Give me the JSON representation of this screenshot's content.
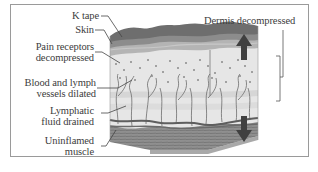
{
  "figure": {
    "labels": {
      "k_tape": "K tape",
      "skin": "Skin",
      "pain_receptors_line1": "Pain receptors",
      "pain_receptors_line2": "decompressed",
      "blood_lymph_line1": "Blood and lymph",
      "blood_lymph_line2": "vessels dilated",
      "lymphatic_line1": "Lymphatic",
      "lymphatic_line2": "fluid drained",
      "muscle_line1": "Uninflamed",
      "muscle_line2": "muscle",
      "dermis": "Dermis decompressed"
    },
    "colors": {
      "frame_border": "#9a9a9a",
      "k_tape_layer": "#6e6e6e",
      "skin_layer": "#8c8c8c",
      "epidermis_band": "#b4b4b4",
      "dermis_fill": "#e6e6e6",
      "dots": "#8a8a8a",
      "vessels": "#7a7a7a",
      "fascia": "#5e5e5e",
      "muscle": "#8f8f8f",
      "arrow": "#404040",
      "leader_lines": "#444444",
      "text": "#3c3c3c"
    },
    "arrows": [
      {
        "name": "up-arrow",
        "direction": "up"
      },
      {
        "name": "down-arrow",
        "direction": "down"
      }
    ]
  }
}
